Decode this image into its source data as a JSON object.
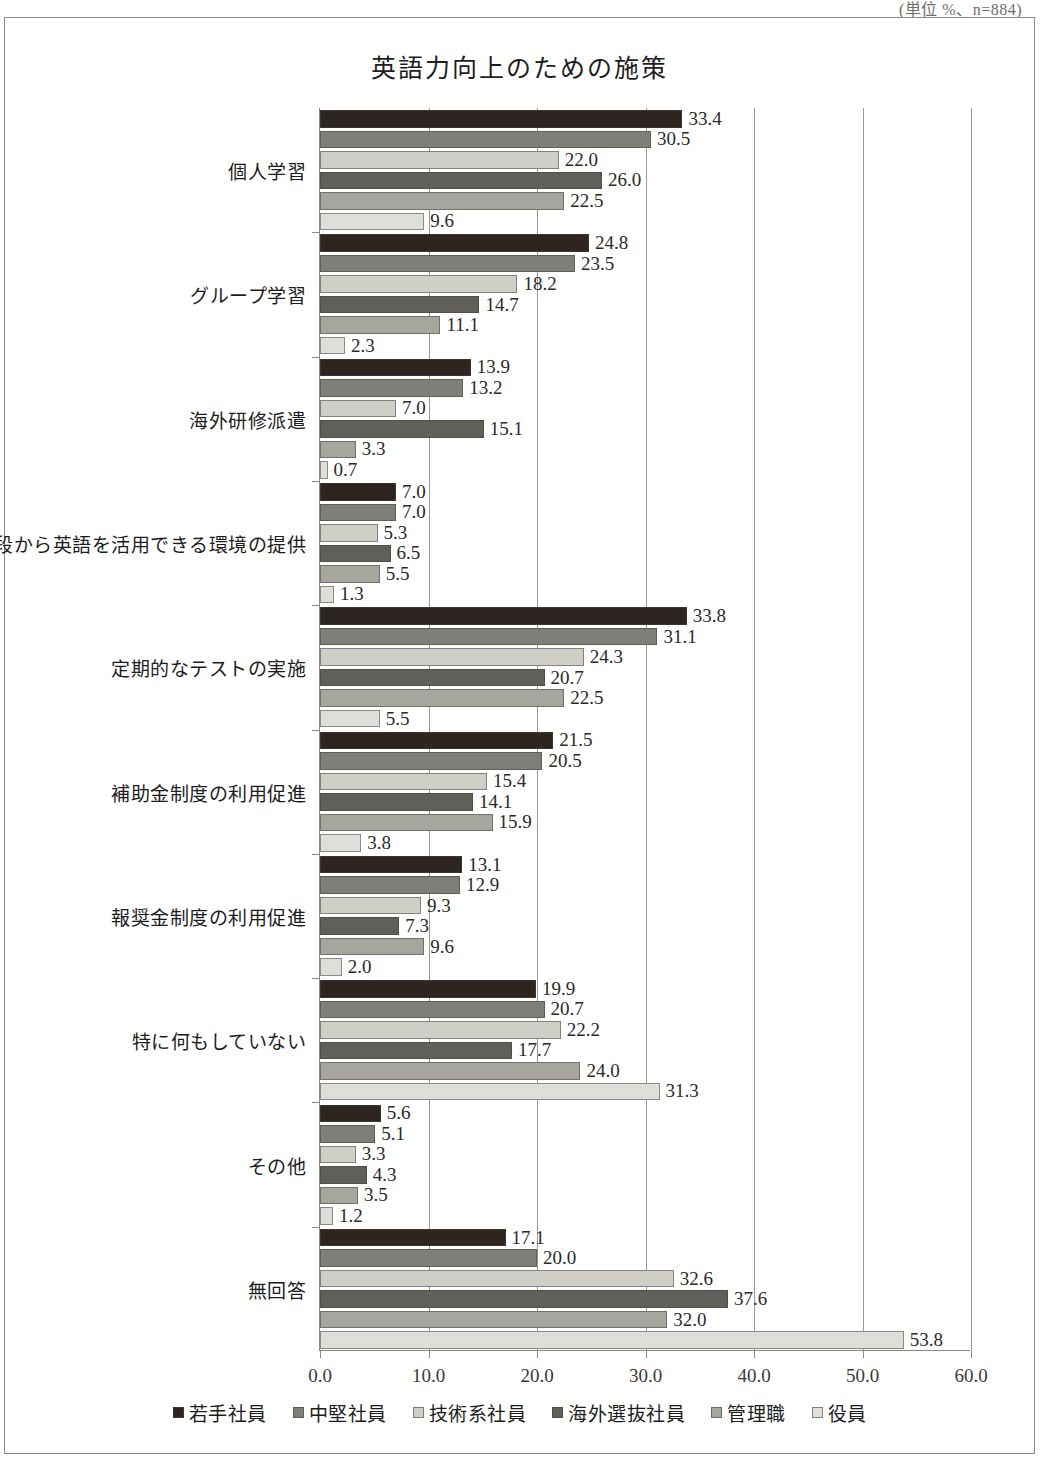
{
  "unit_note": "(単位 %、n=884)",
  "chart_data": {
    "type": "bar",
    "orientation": "horizontal",
    "title": "英語力向上のための施策",
    "xlabel": "",
    "ylabel": "",
    "xlim": [
      0.0,
      60.0
    ],
    "xticks": [
      "0.0",
      "10.0",
      "20.0",
      "30.0",
      "40.0",
      "50.0",
      "60.0"
    ],
    "grid": true,
    "legend_position": "bottom",
    "categories": [
      "個人学習",
      "グループ学習",
      "海外研修派遣",
      "普段から英語を活用できる環境の提供",
      "定期的なテストの実施",
      "補助金制度の利用促進",
      "報奨金制度の利用促進",
      "特に何もしていない",
      "その他",
      "無回答"
    ],
    "series": [
      {
        "name": "若手社員",
        "color": "#2e2520",
        "values": [
          33.4,
          24.8,
          13.9,
          7.0,
          33.8,
          21.5,
          13.1,
          19.9,
          5.6,
          17.1
        ]
      },
      {
        "name": "中堅社員",
        "color": "#7f7e78",
        "values": [
          30.5,
          23.5,
          13.2,
          7.0,
          31.1,
          20.5,
          12.9,
          20.7,
          5.1,
          20.0
        ]
      },
      {
        "name": "技術系社員",
        "color": "#cfcfc8",
        "values": [
          22.0,
          18.2,
          7.0,
          5.3,
          24.3,
          15.4,
          9.3,
          22.2,
          3.3,
          32.6
        ]
      },
      {
        "name": "海外選抜社員",
        "color": "#605f59",
        "values": [
          26.0,
          14.7,
          15.1,
          6.5,
          20.7,
          14.1,
          7.3,
          17.7,
          4.3,
          37.6
        ]
      },
      {
        "name": "管理職",
        "color": "#a6a59e",
        "values": [
          22.5,
          11.1,
          3.3,
          5.5,
          22.5,
          15.9,
          9.6,
          24.0,
          3.5,
          32.0
        ]
      },
      {
        "name": "役員",
        "color": "#dededa",
        "values": [
          9.6,
          2.3,
          0.7,
          1.3,
          5.5,
          3.8,
          2.0,
          31.3,
          1.2,
          53.8
        ]
      }
    ]
  }
}
